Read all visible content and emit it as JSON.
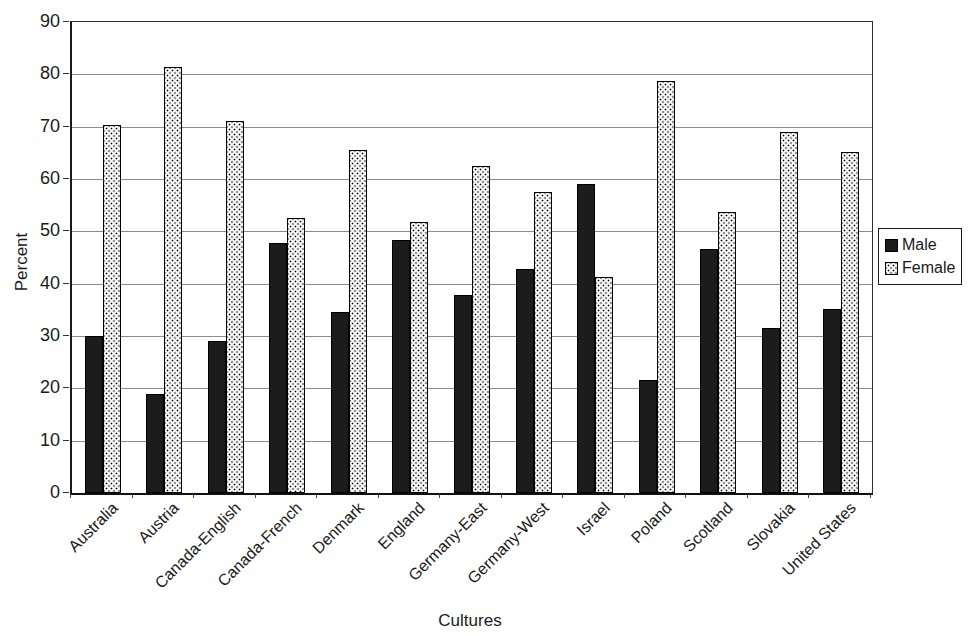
{
  "figure": {
    "background": "#ffffff",
    "text_color": "#1a1a1a"
  },
  "chart_data": {
    "type": "bar",
    "title": "",
    "xlabel": "Cultures",
    "ylabel": "Percent",
    "ylim": [
      0,
      90
    ],
    "yticks": [
      0,
      10,
      20,
      30,
      40,
      50,
      60,
      70,
      80,
      90
    ],
    "grid": "horizontal",
    "legend_position": "right",
    "categories": [
      "Australia",
      "Austria",
      "Canada-English",
      "Canada-French",
      "Denmark",
      "England",
      "Germany-East",
      "Germany-West",
      "Israel",
      "Poland",
      "Scotland",
      "Slovakia",
      "United States"
    ],
    "series": [
      {
        "name": "Male",
        "style": "solid-black",
        "color": "#1c1c1c",
        "values": [
          30.0,
          18.9,
          29.1,
          47.8,
          34.6,
          48.4,
          37.9,
          42.8,
          59.0,
          21.6,
          46.6,
          31.5,
          35.2
        ]
      },
      {
        "name": "Female",
        "style": "stipple-dots",
        "color": "#000000",
        "values": [
          70.3,
          81.4,
          71.0,
          52.5,
          65.5,
          51.8,
          62.4,
          57.5,
          41.3,
          78.8,
          53.7,
          69.0,
          65.2
        ]
      }
    ]
  }
}
